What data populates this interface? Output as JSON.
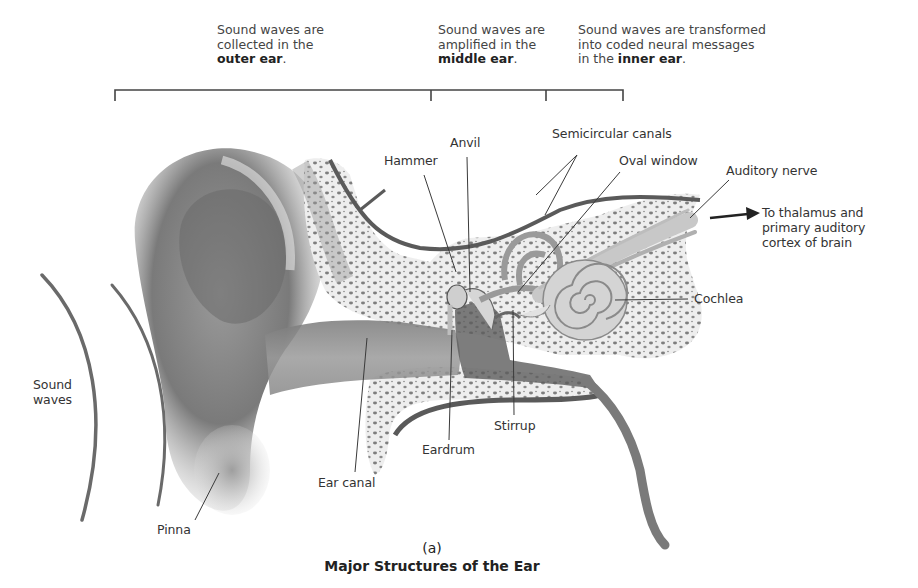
{
  "stages": [
    {
      "line1": "Sound waves are",
      "line2": "collected in the",
      "emph": "outer ear",
      "suffix": "."
    },
    {
      "line1": "Sound waves are",
      "line2": "amplified in the",
      "emph": "middle ear",
      "suffix": "."
    },
    {
      "line1": "Sound waves are transformed",
      "line2": "into coded neural messages",
      "prefix": "in the ",
      "emph": "inner ear",
      "suffix": "."
    }
  ],
  "bracket": {
    "left_x": 115,
    "tick1_x": 431,
    "tick2_x": 546,
    "right_x": 623,
    "y": 90
  },
  "labels": {
    "hammer": "Hammer",
    "anvil": "Anvil",
    "semicircular_canals": "Semicircular canals",
    "oval_window": "Oval window",
    "auditory_nerve": "Auditory nerve",
    "brain_destination_1": "To thalamus and",
    "brain_destination_2": "primary auditory",
    "brain_destination_3": "cortex of brain",
    "cochlea": "Cochlea",
    "sound_waves_1": "Sound",
    "sound_waves_2": "waves",
    "stirrup": "Stirrup",
    "eardrum": "Eardrum",
    "ear_canal": "Ear canal",
    "pinna": "Pinna"
  },
  "caption": {
    "letter": "(a)",
    "title": "Major Structures of the Ear"
  },
  "colors": {
    "line": "#3a3a3a",
    "tissue_dark": "#6e6e6e",
    "tissue_mid": "#a8a8a8",
    "tissue_light": "#d8d8d8",
    "bone": "#ececec",
    "bone_pore": "#8a8a8a"
  }
}
